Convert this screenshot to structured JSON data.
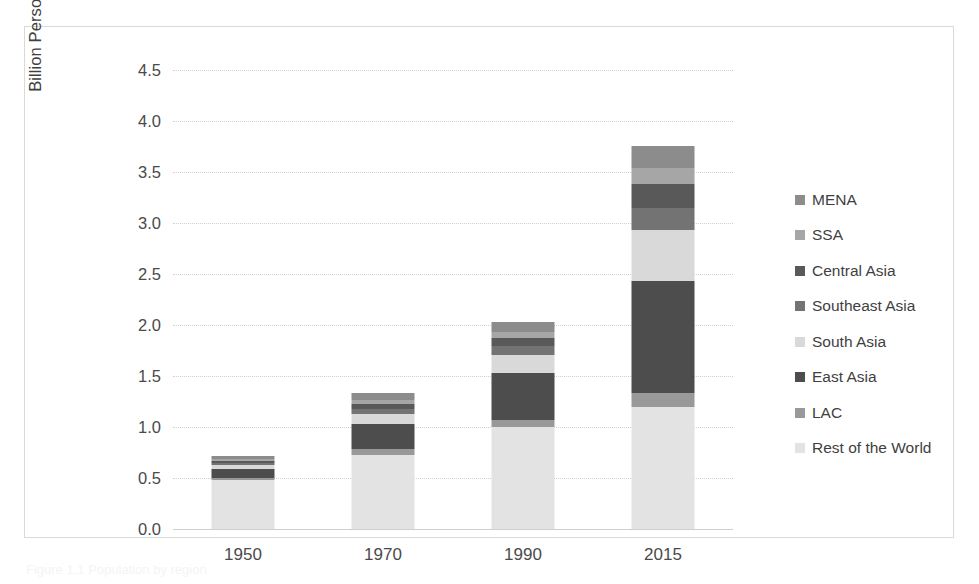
{
  "figure": {
    "caption_remnant": "Figure 1.1  Population by region"
  },
  "chart_data": {
    "type": "bar",
    "subtype": "stacked-vertical",
    "title": "",
    "xlabel": "",
    "ylabel": "Billion Persons",
    "categories": [
      "1950",
      "1970",
      "1990",
      "2015"
    ],
    "ylim": [
      0.0,
      4.5
    ],
    "ytick_labels": [
      "4.5",
      "4.0",
      "3.5",
      "3.0",
      "2.5",
      "2.0",
      "1.5",
      "1.0",
      "0.5",
      "0.0"
    ],
    "ytick_values": [
      4.5,
      4.0,
      3.5,
      3.0,
      2.5,
      2.0,
      1.5,
      1.0,
      0.5,
      0.0
    ],
    "grid": true,
    "legend_position": "right",
    "stack_order_bottom_to_top": [
      "Rest of the World",
      "LAC",
      "East Asia",
      "South Asia",
      "Southeast Asia",
      "Central Asia",
      "SSA",
      "MENA"
    ],
    "series": [
      {
        "name": "MENA",
        "color": "#8c8c8c",
        "values": [
          0.03,
          0.06,
          0.1,
          0.22
        ]
      },
      {
        "name": "SSA",
        "color": "#a6a6a6",
        "values": [
          0.02,
          0.04,
          0.06,
          0.16
        ]
      },
      {
        "name": "Central Asia",
        "color": "#595959",
        "values": [
          0.02,
          0.05,
          0.08,
          0.23
        ]
      },
      {
        "name": "Southeast Asia",
        "color": "#737373",
        "values": [
          0.02,
          0.05,
          0.08,
          0.22
        ]
      },
      {
        "name": "South Asia",
        "color": "#d9d9d9",
        "values": [
          0.04,
          0.1,
          0.18,
          0.5
        ]
      },
      {
        "name": "East Asia",
        "color": "#4d4d4d",
        "values": [
          0.09,
          0.25,
          0.46,
          1.1
        ]
      },
      {
        "name": "LAC",
        "color": "#999999",
        "values": [
          0.02,
          0.05,
          0.07,
          0.13
        ]
      },
      {
        "name": "Rest of the World",
        "color": "#e3e3e3",
        "values": [
          0.48,
          0.73,
          1.0,
          1.2
        ]
      }
    ],
    "totals": [
      0.72,
      1.33,
      2.03,
      3.76
    ],
    "bar_tops_approx": [
      0.74,
      1.35,
      2.26,
      3.93
    ]
  },
  "legend": {
    "items": [
      {
        "label": "MENA",
        "color": "#8c8c8c"
      },
      {
        "label": "SSA",
        "color": "#a6a6a6"
      },
      {
        "label": "Central Asia",
        "color": "#595959"
      },
      {
        "label": "Southeast Asia",
        "color": "#737373"
      },
      {
        "label": "South Asia",
        "color": "#d9d9d9"
      },
      {
        "label": "East Asia",
        "color": "#4d4d4d"
      },
      {
        "label": "LAC",
        "color": "#999999"
      },
      {
        "label": "Rest of the World",
        "color": "#e3e3e3"
      }
    ]
  }
}
